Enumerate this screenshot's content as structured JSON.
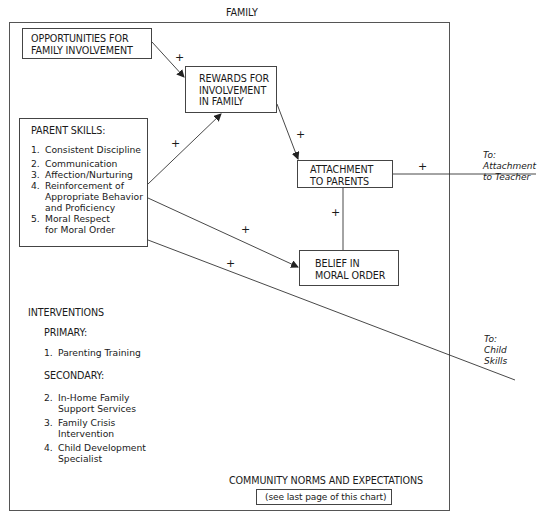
{
  "frame": {
    "title": "FAMILY"
  },
  "nodes": {
    "opportunities": {
      "label_line1": "OPPORTUNITIES FOR",
      "label_line2": "FAMILY INVOLVEMENT"
    },
    "rewards": {
      "label_line1": "REWARDS FOR",
      "label_line2": "INVOLVEMENT",
      "label_line3": "IN FAMILY"
    },
    "parent_skills": {
      "title": "PARENT SKILLS:",
      "items": [
        {
          "num": "1.",
          "text": "Consistent Discipline"
        },
        {
          "num": "2.",
          "text": "Communication"
        },
        {
          "num": "3.",
          "text": "Affection/Nurturing"
        },
        {
          "num": "4.",
          "text": "Reinforcement of\nAppropriate Behavior\nand Proficiency"
        },
        {
          "num": "5.",
          "text": "Moral Respect\nfor Moral Order"
        }
      ]
    },
    "attachment": {
      "label_line1": "ATTACHMENT",
      "label_line2": "TO PARENTS"
    },
    "belief": {
      "label_line1": "BELIEF IN",
      "label_line2": "MORAL ORDER"
    }
  },
  "edges": [
    {
      "from": "opportunities",
      "to": "rewards",
      "sign": "+"
    },
    {
      "from": "parent_skills",
      "to": "rewards",
      "sign": "+"
    },
    {
      "from": "rewards",
      "to": "attachment",
      "sign": "+"
    },
    {
      "from": "attachment",
      "to": "attachment_to_teacher",
      "sign": "+"
    },
    {
      "from": "attachment",
      "to": "belief",
      "sign": "+"
    },
    {
      "from": "parent_skills",
      "to": "belief",
      "sign": "+"
    },
    {
      "from": "parent_skills",
      "to": "child_skills",
      "sign": "+"
    }
  ],
  "external": {
    "teacher": {
      "line1": "To:",
      "line2": "Attachment",
      "line3": "to Teacher"
    },
    "child": {
      "line1": "To:",
      "line2": "Child",
      "line3": "Skills"
    }
  },
  "interventions": {
    "heading": "INTERVENTIONS",
    "primary_label": "PRIMARY:",
    "primary_items": [
      {
        "num": "1.",
        "text": "Parenting Training"
      }
    ],
    "secondary_label": "SECONDARY:",
    "secondary_items": [
      {
        "num": "2.",
        "text": "In-Home Family\nSupport Services"
      },
      {
        "num": "3.",
        "text": "Family Crisis\nIntervention"
      },
      {
        "num": "4.",
        "text": "Child Development\nSpecialist"
      }
    ]
  },
  "footer": {
    "community": "COMMUNITY NORMS AND EXPECTATIONS",
    "note": "(see last page of this chart)"
  }
}
